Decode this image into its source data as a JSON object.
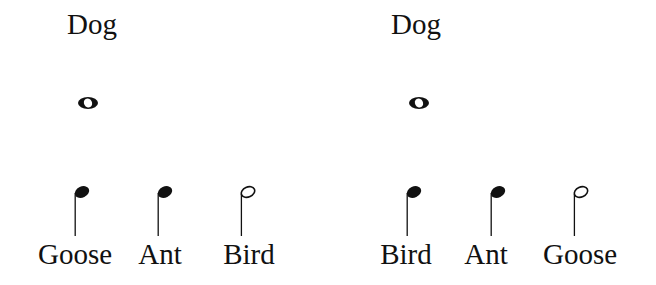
{
  "panels": [
    {
      "top": {
        "label": "Dog",
        "note": "whole"
      },
      "bottom": [
        {
          "label": "Goose",
          "note": "quarter"
        },
        {
          "label": "Ant",
          "note": "quarter"
        },
        {
          "label": "Bird",
          "note": "half"
        }
      ]
    },
    {
      "top": {
        "label": "Dog",
        "note": "whole"
      },
      "bottom": [
        {
          "label": "Bird",
          "note": "quarter"
        },
        {
          "label": "Ant",
          "note": "quarter"
        },
        {
          "label": "Goose",
          "note": "half"
        }
      ]
    }
  ],
  "colors": {
    "ink": "#111111",
    "background": "#ffffff"
  }
}
